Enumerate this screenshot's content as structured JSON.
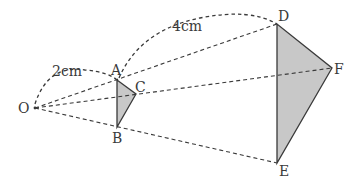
{
  "diagram": {
    "type": "homothety / similar triangles",
    "center": {
      "label": "O"
    },
    "small_triangle": {
      "vertices": [
        "A",
        "B",
        "C"
      ],
      "fill": "#c8c8c8"
    },
    "large_triangle": {
      "vertices": [
        "D",
        "E",
        "F"
      ],
      "fill": "#c8c8c8"
    },
    "labels": {
      "O": "O",
      "A": "A",
      "B": "B",
      "C": "C",
      "D": "D",
      "E": "E",
      "F": "F"
    },
    "measurements": {
      "OA": "2cm",
      "AD": "4cm"
    },
    "colors": {
      "stroke": "#3a3a3a",
      "fill": "#c8c8c8",
      "background": "#ffffff"
    }
  }
}
